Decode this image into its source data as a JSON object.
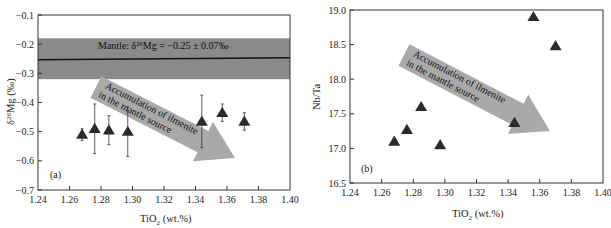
{
  "chart_data": [
    {
      "type": "scatter",
      "panel_label": "(a)",
      "title": "",
      "xlabel": "TiO2 (wt.%)",
      "ylabel": "δ26Mg (‰)",
      "xlim": [
        1.24,
        1.4
      ],
      "ylim": [
        -0.7,
        -0.1
      ],
      "xticks": [
        "1.24",
        "1.26",
        "1.28",
        "1.30",
        "1.32",
        "1.34",
        "1.36",
        "1.38",
        "1.40"
      ],
      "yticks": [
        "-0.1",
        "-0.2",
        "-0.3",
        "-0.4",
        "-0.5",
        "-0.6",
        "-0.7"
      ],
      "grid": false,
      "marker": "triangle",
      "points": [
        {
          "x": 1.268,
          "y": -0.51,
          "err": 0.02
        },
        {
          "x": 1.276,
          "y": -0.49,
          "err": 0.085
        },
        {
          "x": 1.285,
          "y": -0.495,
          "err": 0.05
        },
        {
          "x": 1.297,
          "y": -0.5,
          "err": 0.085
        },
        {
          "x": 1.344,
          "y": -0.465,
          "err": 0.09
        },
        {
          "x": 1.357,
          "y": -0.435,
          "err": 0.03
        },
        {
          "x": 1.371,
          "y": -0.465,
          "err": 0.03
        }
      ],
      "mantle_band": {
        "center": -0.25,
        "low": -0.32,
        "high": -0.18,
        "label": "Mantle: δ26Mg = −0.25 ± 0.07‰"
      },
      "arrow_annotation": "Accumulation of ilmenite in the mantle source",
      "colors": {
        "band": "#8a8a8a",
        "arrow": "#a9a9a9",
        "marker": "#2b2b2b"
      }
    },
    {
      "type": "scatter",
      "panel_label": "(b)",
      "title": "",
      "xlabel": "TiO2 (wt.%)",
      "ylabel": "Nb/Ta",
      "xlim": [
        1.24,
        1.4
      ],
      "ylim": [
        16.5,
        19.0
      ],
      "xticks": [
        "1.24",
        "1.26",
        "1.28",
        "1.30",
        "1.32",
        "1.34",
        "1.36",
        "1.38",
        "1.40"
      ],
      "yticks": [
        "19.0",
        "18.5",
        "18.0",
        "17.5",
        "17.0",
        "16.5"
      ],
      "grid": false,
      "marker": "triangle",
      "points": [
        {
          "x": 1.268,
          "y": 17.1
        },
        {
          "x": 1.276,
          "y": 17.27
        },
        {
          "x": 1.285,
          "y": 17.6
        },
        {
          "x": 1.297,
          "y": 17.05
        },
        {
          "x": 1.344,
          "y": 17.37
        },
        {
          "x": 1.356,
          "y": 18.9
        },
        {
          "x": 1.37,
          "y": 18.48
        }
      ],
      "arrow_annotation": "Accumulation of ilmenite in the mantle source",
      "colors": {
        "arrow": "#a9a9a9",
        "marker": "#2b2b2b"
      }
    }
  ],
  "panel_a": {
    "label": "(a)",
    "xlabel_main": "TiO",
    "xlabel_sub": "2",
    "xlabel_rest": " (wt.%)",
    "ylabel_sup": "26",
    "ylabel_pre": "δ",
    "ylabel_rest": "Mg (‰)",
    "band_label": "Mantle: δ²⁶Mg = −0.25 ± 0.07‰",
    "arrow_line1": "Accumulation of ilmenite",
    "arrow_line2": "in the mantle source"
  },
  "panel_b": {
    "label": "(b)",
    "xlabel_main": "TiO",
    "xlabel_sub": "2",
    "xlabel_rest": " (wt.%)",
    "ylabel": "Nb/Ta",
    "arrow_line1": "Accumulation of ilmenite",
    "arrow_line2": "in the mantle source"
  }
}
